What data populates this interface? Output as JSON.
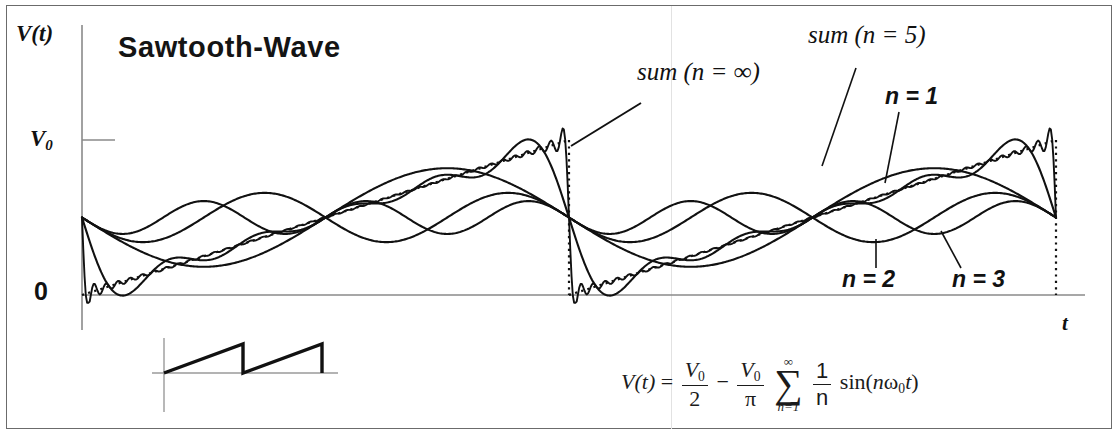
{
  "figure": {
    "title": "Sawtooth-Wave",
    "y_axis_label": "V(t)",
    "y_axis_label_main": "V",
    "y_axis_label_arg": "(t)",
    "x_axis_label": "t",
    "y_tick_top": "V",
    "y_tick_top_sub": "0",
    "y_tick_zero": "0"
  },
  "annotations": {
    "sum_infinite": "sum  (n = ∞)",
    "sum_five": "sum  (n = 5)",
    "harmonic_1": "n = 1",
    "harmonic_2": "n = 2",
    "harmonic_3": "n = 3"
  },
  "formula": {
    "lhs_fn": "V",
    "lhs_arg": "(t)",
    "equals": "=",
    "term1_num": "V",
    "term1_num_sub": "0",
    "term1_den": "2",
    "minus": "−",
    "term2_num": "V",
    "term2_num_sub": "0",
    "term2_den": "π",
    "sigma_top": "∞",
    "sigma_symbol": "∑",
    "sigma_bottom": "n=1",
    "frac_num": "1",
    "frac_den": "n",
    "sin_open": "sin(",
    "sin_n": "n",
    "sin_omega": "ω",
    "sin_omega_sub": "0",
    "sin_t": "t",
    "sin_close": ")"
  },
  "inset": {
    "name": "sawtooth-waveform-inset",
    "periods": 2,
    "description": "ideal sawtooth ramp with sharp fall"
  },
  "colors": {
    "curve": "#111111",
    "axis": "#8a8a8a",
    "frame": "#6b6b6b",
    "dotted": "#111111",
    "background": "#ffffff"
  },
  "chart_data": {
    "type": "line",
    "title": "Sawtooth-Wave",
    "xlabel": "t",
    "ylabel": "V(t)",
    "xlim": [
      0,
      2
    ],
    "ylim": [
      0,
      1
    ],
    "ytick_labels": [
      "0",
      "V0"
    ],
    "ytick_values": [
      0,
      1
    ],
    "grid": false,
    "legend": "inline-annotations",
    "formula_text": "V(t) = V0/2 - (V0/pi) * sum_{n=1}^{inf} (1/n) sin(n*w0*t)",
    "series": [
      {
        "name": "sum (n = ∞)",
        "kind": "fourier-sum",
        "terms": 40,
        "amplitude_scale": 1.0,
        "dc_offset": 0.5,
        "style": "solid"
      },
      {
        "name": "sum (n = 5)",
        "kind": "fourier-sum",
        "terms": 5,
        "amplitude_scale": 1.0,
        "dc_offset": 0.5,
        "style": "solid"
      },
      {
        "name": "n = 1",
        "kind": "harmonic",
        "harmonic": 1,
        "amplitude": 0.318,
        "dc_offset": 0.5,
        "style": "solid"
      },
      {
        "name": "n = 2",
        "kind": "harmonic",
        "harmonic": 2,
        "amplitude": 0.159,
        "dc_offset": 0.5,
        "style": "solid"
      },
      {
        "name": "n = 3",
        "kind": "harmonic",
        "harmonic": 3,
        "amplitude": 0.106,
        "dc_offset": 0.5,
        "style": "solid"
      },
      {
        "name": "ideal sawtooth",
        "kind": "sawtooth",
        "periods": 2,
        "style": "dotted"
      }
    ]
  },
  "geometry": {
    "axis_x": 82,
    "axis_y": 295,
    "v0_y": 140,
    "plot_right": 1085,
    "period_px": 487,
    "period_start": 82,
    "period_mid": 569,
    "period_end": 1056
  }
}
